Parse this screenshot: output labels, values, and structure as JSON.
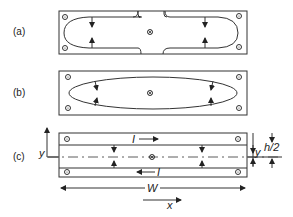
{
  "panels": [
    {
      "id": "a",
      "label": "(a)",
      "description": "Rectangular plate with notched top/bottom edges; closed loop current contour with inward arrows"
    },
    {
      "id": "b",
      "label": "(b)",
      "description": "Rectangular plate; elliptical closed loop contour with inward arrows"
    },
    {
      "id": "c",
      "label": "(c)",
      "description": "Rectangular plate with two strips carrying opposite currents I; dimensions W, h/2, y, x"
    }
  ],
  "symbols": {
    "center_marker": "⊗",
    "corner_marker": "⊙"
  },
  "annotations": {
    "current_top": "I",
    "current_bottom": "I",
    "width": "W",
    "x_axis": "x",
    "y_left": "y",
    "y_right": "y",
    "half_height": "h/2"
  }
}
